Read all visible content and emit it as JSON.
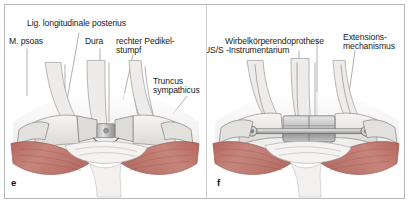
{
  "figure": {
    "panels": [
      {
        "letter": "e",
        "labels": [
          {
            "name": "lig-longitudinale-posterius",
            "text": "Lig. longitudinale posterius"
          },
          {
            "name": "m-psoas",
            "text": "M. psoas"
          },
          {
            "name": "dura",
            "text": "Dura"
          },
          {
            "name": "rechter-pedikelstumpf-line1",
            "text": "rechter Pedikel-"
          },
          {
            "name": "rechter-pedikelstumpf-line2",
            "text": "stumpf"
          },
          {
            "name": "truncus-sympathicus-line1",
            "text": "Truncus"
          },
          {
            "name": "truncus-sympathicus-line2",
            "text": "sympathicus"
          }
        ]
      },
      {
        "letter": "f",
        "labels": [
          {
            "name": "wirbelkoerperendoprothese",
            "text": "Wirbelkörperendoprothese"
          },
          {
            "name": "us-s-instrumentarium",
            "text": "US/S -Instrumentarium"
          },
          {
            "name": "extensionsmechanismus-line1",
            "text": "Extensions-"
          },
          {
            "name": "extensionsmechanismus-line2",
            "text": "mechanismus"
          }
        ]
      }
    ]
  },
  "colors": {
    "muscle": "#c28179",
    "muscle_shadow": "#a96258",
    "bone": "#e8e6e3",
    "metal": "#d2d2d2",
    "metal_dark": "#9a9a9a",
    "frame": "#b9b9b9",
    "text": "#1b1b1b",
    "leader": "#8d8d8d"
  }
}
